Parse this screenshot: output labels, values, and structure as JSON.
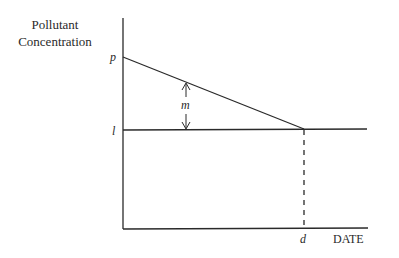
{
  "diagram": {
    "y_axis_label": [
      "Pollutant",
      "Concentration"
    ],
    "x_axis_label": "DATE",
    "labels": {
      "p": "p",
      "l": "l",
      "m": "m",
      "d": "d"
    }
  },
  "colors": {
    "line": "#2a2a2a",
    "background": "#ffffff"
  }
}
